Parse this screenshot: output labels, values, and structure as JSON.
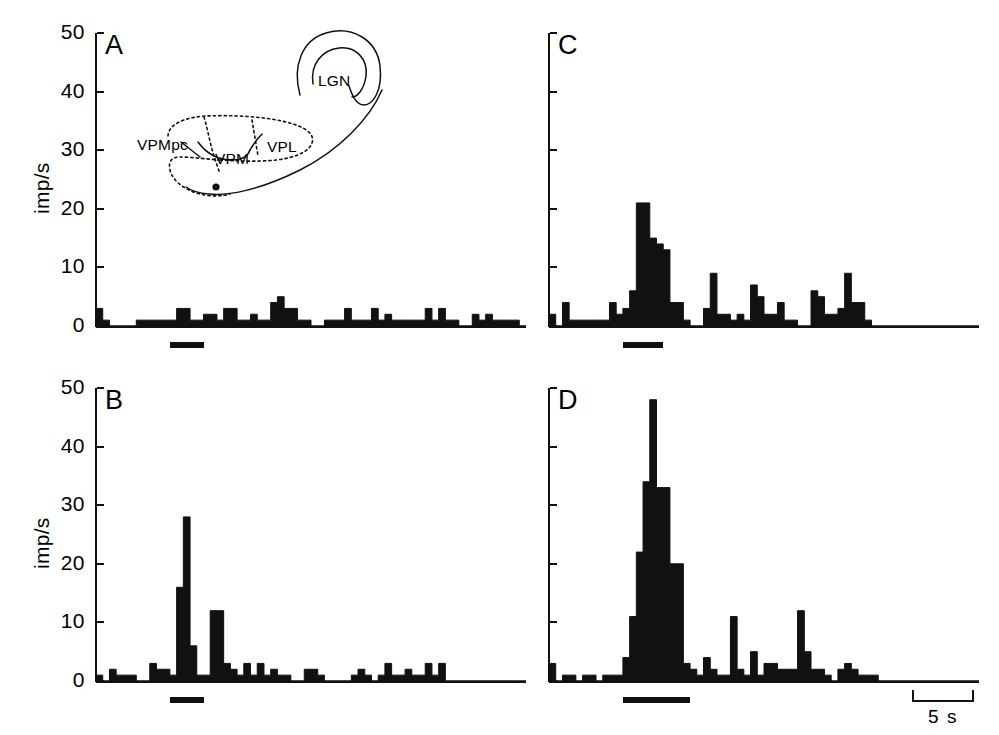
{
  "figure": {
    "panels": [
      "A",
      "B",
      "C",
      "D"
    ],
    "y_axis_title": "imp/s",
    "y_ticks": [
      0,
      10,
      20,
      30,
      40,
      50
    ],
    "y_tick_labels": [
      "0",
      "10",
      "20",
      "30",
      "40",
      "50"
    ],
    "scale_bar_label": "5 s",
    "ink_color": "#111111",
    "background_color": "#ffffff"
  },
  "inset": {
    "name": "thalamus-schematic",
    "labels": [
      {
        "text": "LGN",
        "x": 318,
        "y": 72
      },
      {
        "text": "VPMpc",
        "x": 137,
        "y": 136
      },
      {
        "text": "VPM",
        "x": 215,
        "y": 150
      },
      {
        "text": "VPL",
        "x": 267,
        "y": 138
      }
    ],
    "recording_site_marker": "filled-dot"
  },
  "chart_data": [
    {
      "type": "bar",
      "panel": "A",
      "title": "A",
      "ylabel": "imp/s",
      "xlabel": "",
      "ylim": [
        0,
        50
      ],
      "yticks": [
        0,
        10,
        20,
        30,
        40,
        50
      ],
      "grid": false,
      "legend": "none",
      "bin_count": 64,
      "stimulus_bar": {
        "start_bin": 11,
        "end_bin": 16,
        "label": ""
      },
      "values": [
        3,
        1,
        0,
        0,
        0,
        0,
        1,
        1,
        1,
        1,
        1,
        1,
        3,
        3,
        1,
        1,
        2,
        2,
        1,
        3,
        3,
        1,
        1,
        2,
        1,
        1,
        4,
        5,
        3,
        3,
        1,
        1,
        0,
        0,
        1,
        1,
        1,
        3,
        1,
        1,
        1,
        3,
        1,
        2,
        1,
        1,
        1,
        1,
        1,
        3,
        1,
        3,
        1,
        1,
        0,
        0,
        2,
        1,
        2,
        1,
        1,
        1,
        1,
        0
      ]
    },
    {
      "type": "bar",
      "panel": "B",
      "title": "B",
      "ylabel": "imp/s",
      "xlabel": "",
      "ylim": [
        0,
        50
      ],
      "yticks": [
        0,
        10,
        20,
        30,
        40,
        50
      ],
      "grid": false,
      "legend": "none",
      "bin_count": 64,
      "stimulus_bar": {
        "start_bin": 11,
        "end_bin": 16,
        "label": ""
      },
      "values": [
        1,
        0,
        2,
        1,
        1,
        1,
        0,
        0,
        3,
        2,
        2,
        1,
        16,
        28,
        6,
        1,
        1,
        12,
        12,
        3,
        2,
        1,
        3,
        1,
        3,
        1,
        2,
        1,
        1,
        0,
        0,
        2,
        2,
        1,
        0,
        0,
        0,
        0,
        1,
        2,
        1,
        0,
        1,
        3,
        1,
        1,
        2,
        1,
        1,
        3,
        1,
        3,
        0,
        0,
        0,
        0,
        0,
        0,
        0,
        0,
        0,
        0,
        0,
        0
      ]
    },
    {
      "type": "bar",
      "panel": "C",
      "title": "C",
      "ylabel": "",
      "xlabel": "",
      "ylim": [
        0,
        50
      ],
      "yticks": [
        0,
        10,
        20,
        30,
        40,
        50
      ],
      "grid": false,
      "legend": "none",
      "bin_count": 64,
      "stimulus_bar": {
        "start_bin": 11,
        "end_bin": 17,
        "label": ""
      },
      "values": [
        2,
        0,
        4,
        1,
        1,
        1,
        1,
        1,
        1,
        4,
        2,
        3,
        6,
        21,
        21,
        15,
        14,
        13,
        4,
        4,
        1,
        0,
        0,
        3,
        9,
        2,
        2,
        1,
        2,
        1,
        7,
        5,
        2,
        2,
        4,
        1,
        1,
        0,
        0,
        6,
        5,
        2,
        2,
        3,
        9,
        4,
        4,
        1,
        0,
        0,
        0,
        0,
        0,
        0,
        0,
        0,
        0,
        0,
        0,
        0,
        0,
        0,
        0,
        0
      ]
    },
    {
      "type": "bar",
      "panel": "D",
      "title": "D",
      "ylabel": "",
      "xlabel": "",
      "ylim": [
        0,
        50
      ],
      "yticks": [
        0,
        10,
        20,
        30,
        40,
        50
      ],
      "grid": false,
      "legend": "none",
      "bin_count": 64,
      "stimulus_bar": {
        "start_bin": 11,
        "end_bin": 21,
        "label": ""
      },
      "values": [
        3,
        0,
        1,
        1,
        0,
        1,
        1,
        0,
        1,
        1,
        1,
        4,
        11,
        22,
        34,
        48,
        33,
        33,
        20,
        20,
        3,
        2,
        1,
        4,
        2,
        1,
        1,
        11,
        2,
        1,
        5,
        1,
        3,
        3,
        2,
        2,
        2,
        12,
        5,
        2,
        2,
        1,
        0,
        2,
        3,
        2,
        1,
        1,
        1,
        0,
        0,
        0,
        0,
        0,
        0,
        0,
        0,
        0,
        0,
        0,
        0,
        0,
        0,
        0
      ]
    }
  ]
}
